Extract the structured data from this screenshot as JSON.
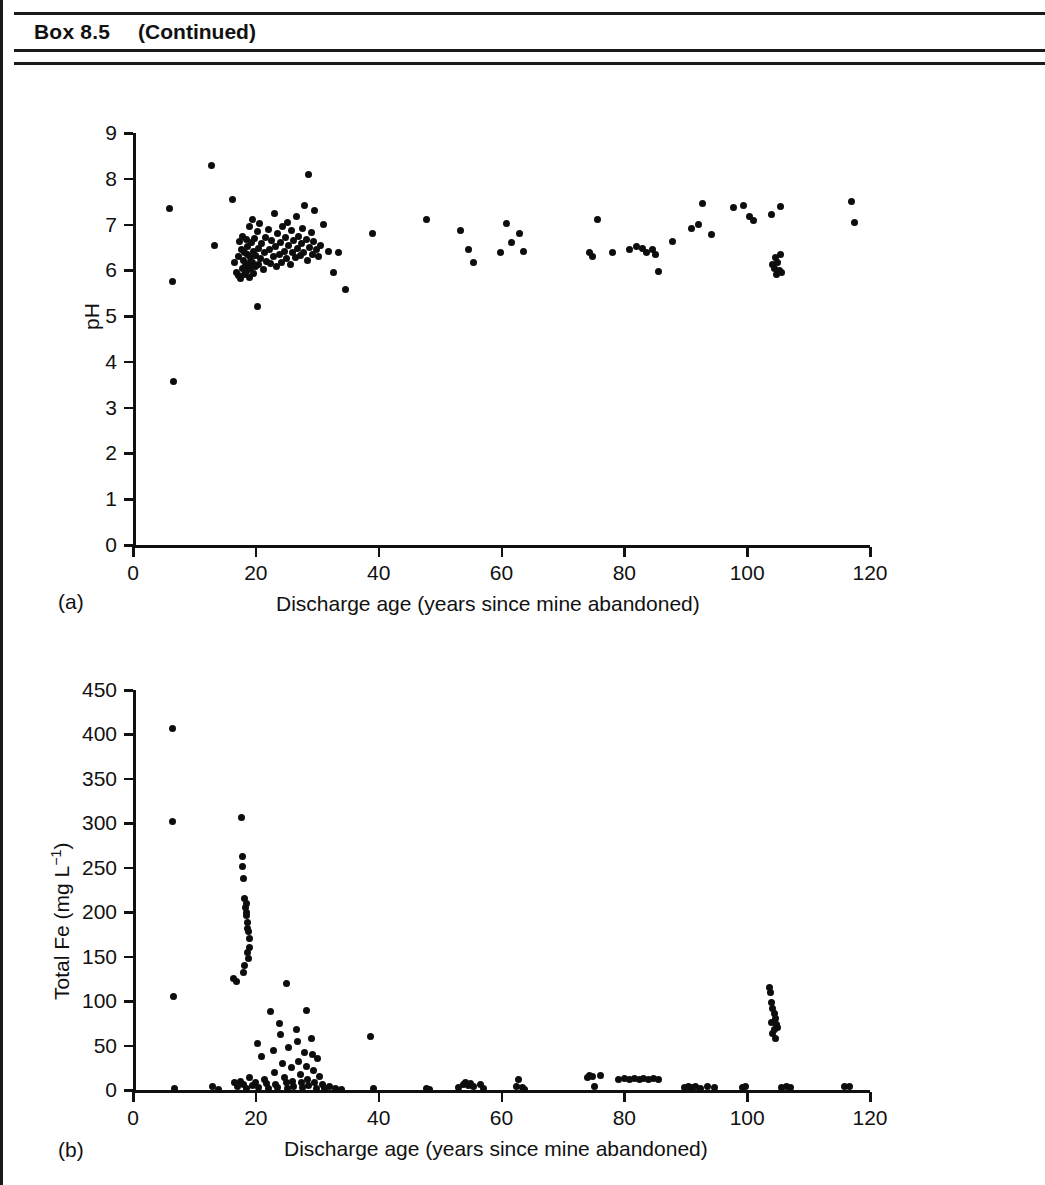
{
  "header": {
    "box_label": "Box 8.5",
    "continued_label": "(Continued)"
  },
  "panels": [
    {
      "label": "(a)"
    },
    {
      "label": "(b)"
    }
  ],
  "chart_data": [
    {
      "type": "scatter",
      "panel": "(a)",
      "title": "",
      "xlabel": "Discharge age (years since mine abandoned)",
      "ylabel": "pH",
      "xlim": [
        0,
        120
      ],
      "ylim": [
        0,
        9
      ],
      "xticks": [
        0,
        20,
        40,
        60,
        80,
        100,
        120
      ],
      "yticks": [
        0,
        1,
        2,
        3,
        4,
        5,
        6,
        7,
        8,
        9
      ],
      "grid": false,
      "legend": "none",
      "marker": "filled-circle",
      "marker_color": "#0d0d0d",
      "points": [
        [
          6.0,
          7.35
        ],
        [
          6.4,
          5.75
        ],
        [
          6.6,
          3.58
        ],
        [
          12.8,
          8.3
        ],
        [
          13.2,
          6.55
        ],
        [
          16.2,
          7.55
        ],
        [
          16.6,
          6.18
        ],
        [
          16.9,
          5.95
        ],
        [
          17.1,
          6.3
        ],
        [
          17.2,
          5.88
        ],
        [
          17.4,
          6.62
        ],
        [
          17.5,
          5.82
        ],
        [
          17.6,
          6.45
        ],
        [
          17.8,
          6.05
        ],
        [
          17.9,
          6.75
        ],
        [
          18.0,
          6.22
        ],
        [
          18.1,
          5.9
        ],
        [
          18.2,
          6.4
        ],
        [
          18.3,
          6.1
        ],
        [
          18.4,
          6.68
        ],
        [
          18.5,
          5.98
        ],
        [
          18.6,
          6.35
        ],
        [
          18.7,
          6.52
        ],
        [
          18.8,
          6.15
        ],
        [
          18.9,
          5.85
        ],
        [
          19.0,
          6.95
        ],
        [
          19.1,
          6.28
        ],
        [
          19.2,
          6.05
        ],
        [
          19.3,
          6.6
        ],
        [
          19.4,
          6.18
        ],
        [
          19.5,
          7.12
        ],
        [
          19.6,
          5.92
        ],
        [
          19.7,
          6.42
        ],
        [
          19.8,
          6.7
        ],
        [
          19.9,
          6.08
        ],
        [
          20.0,
          6.32
        ],
        [
          20.2,
          6.85
        ],
        [
          20.3,
          5.22
        ],
        [
          20.4,
          6.48
        ],
        [
          20.5,
          6.12
        ],
        [
          20.6,
          7.02
        ],
        [
          20.8,
          6.25
        ],
        [
          21.0,
          6.58
        ],
        [
          21.2,
          6.02
        ],
        [
          21.4,
          6.38
        ],
        [
          21.6,
          6.72
        ],
        [
          21.8,
          6.2
        ],
        [
          22.0,
          6.9
        ],
        [
          22.2,
          6.45
        ],
        [
          22.4,
          6.15
        ],
        [
          22.6,
          6.65
        ],
        [
          22.8,
          6.3
        ],
        [
          23.0,
          7.25
        ],
        [
          23.2,
          6.52
        ],
        [
          23.4,
          6.08
        ],
        [
          23.6,
          6.8
        ],
        [
          23.8,
          6.35
        ],
        [
          24.0,
          6.6
        ],
        [
          24.2,
          6.18
        ],
        [
          24.4,
          6.95
        ],
        [
          24.6,
          6.42
        ],
        [
          24.8,
          6.72
        ],
        [
          25.0,
          6.25
        ],
        [
          25.2,
          7.05
        ],
        [
          25.4,
          6.55
        ],
        [
          25.6,
          6.12
        ],
        [
          25.8,
          6.88
        ],
        [
          26.0,
          6.38
        ],
        [
          26.2,
          6.65
        ],
        [
          26.4,
          6.28
        ],
        [
          26.6,
          7.18
        ],
        [
          26.8,
          6.48
        ],
        [
          27.0,
          6.75
        ],
        [
          27.2,
          6.32
        ],
        [
          27.4,
          6.58
        ],
        [
          27.6,
          6.92
        ],
        [
          27.8,
          6.4
        ],
        [
          28.0,
          7.42
        ],
        [
          28.2,
          6.68
        ],
        [
          28.4,
          6.22
        ],
        [
          28.6,
          8.1
        ],
        [
          28.8,
          6.5
        ],
        [
          29.0,
          6.82
        ],
        [
          29.2,
          6.35
        ],
        [
          29.4,
          6.62
        ],
        [
          29.6,
          7.3
        ],
        [
          29.8,
          6.45
        ],
        [
          30.2,
          6.3
        ],
        [
          30.6,
          6.55
        ],
        [
          31.0,
          7.0
        ],
        [
          31.8,
          6.42
        ],
        [
          32.6,
          5.95
        ],
        [
          33.4,
          6.4
        ],
        [
          34.6,
          5.58
        ],
        [
          39.0,
          6.8
        ],
        [
          47.8,
          7.1
        ],
        [
          53.4,
          6.88
        ],
        [
          54.6,
          6.45
        ],
        [
          55.4,
          6.18
        ],
        [
          59.8,
          6.4
        ],
        [
          60.8,
          7.02
        ],
        [
          61.6,
          6.6
        ],
        [
          63.0,
          6.8
        ],
        [
          63.6,
          6.42
        ],
        [
          74.4,
          6.38
        ],
        [
          74.8,
          6.3
        ],
        [
          75.6,
          7.12
        ],
        [
          78.0,
          6.4
        ],
        [
          80.8,
          6.45
        ],
        [
          82.0,
          6.52
        ],
        [
          83.0,
          6.48
        ],
        [
          83.6,
          6.4
        ],
        [
          84.6,
          6.45
        ],
        [
          85.0,
          6.35
        ],
        [
          85.6,
          5.98
        ],
        [
          87.8,
          6.62
        ],
        [
          91.0,
          6.92
        ],
        [
          92.0,
          7.0
        ],
        [
          92.8,
          7.45
        ],
        [
          94.2,
          6.78
        ],
        [
          97.8,
          7.38
        ],
        [
          99.4,
          7.42
        ],
        [
          100.4,
          7.18
        ],
        [
          101.0,
          7.08
        ],
        [
          104.2,
          6.12
        ],
        [
          104.4,
          6.05
        ],
        [
          104.6,
          6.28
        ],
        [
          104.8,
          5.9
        ],
        [
          105.0,
          6.18
        ],
        [
          105.2,
          6.0
        ],
        [
          105.4,
          6.35
        ],
        [
          105.6,
          5.95
        ],
        [
          104.0,
          7.22
        ],
        [
          105.4,
          7.4
        ],
        [
          117.0,
          7.5
        ],
        [
          117.4,
          7.05
        ]
      ]
    },
    {
      "type": "scatter",
      "panel": "(b)",
      "title": "",
      "xlabel": "Discharge age (years since mine abandoned)",
      "ylabel": "Total Fe (mg L",
      "ylabel_sup": "−1",
      "ylabel_tail": ")",
      "xlim": [
        0,
        120
      ],
      "ylim": [
        0,
        450
      ],
      "xticks": [
        0,
        20,
        40,
        60,
        80,
        100,
        120
      ],
      "yticks": [
        0,
        50,
        100,
        150,
        200,
        250,
        300,
        350,
        400,
        450
      ],
      "grid": false,
      "legend": "none",
      "marker": "filled-circle",
      "marker_color": "#0d0d0d",
      "points": [
        [
          6.4,
          407
        ],
        [
          6.4,
          302
        ],
        [
          6.6,
          105
        ],
        [
          6.8,
          2
        ],
        [
          13.0,
          4
        ],
        [
          14.0,
          1
        ],
        [
          16.4,
          126
        ],
        [
          16.8,
          122
        ],
        [
          17.6,
          307
        ],
        [
          17.8,
          263
        ],
        [
          17.9,
          251
        ],
        [
          18.0,
          238
        ],
        [
          18.2,
          215
        ],
        [
          18.3,
          205
        ],
        [
          18.4,
          200
        ],
        [
          18.5,
          196
        ],
        [
          18.6,
          188
        ],
        [
          18.7,
          182
        ],
        [
          18.8,
          178
        ],
        [
          18.4,
          210
        ],
        [
          18.9,
          170
        ],
        [
          19.0,
          160
        ],
        [
          18.6,
          155
        ],
        [
          18.8,
          148
        ],
        [
          18.2,
          140
        ],
        [
          18.0,
          132
        ],
        [
          16.5,
          8
        ],
        [
          17.0,
          4
        ],
        [
          17.5,
          10
        ],
        [
          18.0,
          6
        ],
        [
          18.5,
          2
        ],
        [
          19.0,
          14
        ],
        [
          19.5,
          5
        ],
        [
          20.0,
          9
        ],
        [
          20.5,
          3
        ],
        [
          20.2,
          52
        ],
        [
          21.0,
          38
        ],
        [
          21.4,
          12
        ],
        [
          21.8,
          7
        ],
        [
          22.0,
          2
        ],
        [
          22.4,
          88
        ],
        [
          22.8,
          45
        ],
        [
          23.0,
          20
        ],
        [
          23.2,
          6
        ],
        [
          23.6,
          3
        ],
        [
          23.8,
          75
        ],
        [
          24.0,
          62
        ],
        [
          24.4,
          30
        ],
        [
          24.6,
          14
        ],
        [
          25.0,
          8
        ],
        [
          25.2,
          2
        ],
        [
          25.4,
          48
        ],
        [
          25.8,
          25
        ],
        [
          26.0,
          10
        ],
        [
          26.2,
          4
        ],
        [
          26.6,
          68
        ],
        [
          26.8,
          55
        ],
        [
          27.0,
          32
        ],
        [
          27.2,
          18
        ],
        [
          27.4,
          8
        ],
        [
          27.6,
          3
        ],
        [
          28.0,
          42
        ],
        [
          28.2,
          26
        ],
        [
          28.4,
          12
        ],
        [
          28.6,
          5
        ],
        [
          29.0,
          58
        ],
        [
          29.2,
          40
        ],
        [
          29.4,
          22
        ],
        [
          29.6,
          9
        ],
        [
          29.8,
          2
        ],
        [
          30.0,
          35
        ],
        [
          30.4,
          15
        ],
        [
          30.8,
          6
        ],
        [
          31.2,
          2
        ],
        [
          32.0,
          4
        ],
        [
          25.0,
          120
        ],
        [
          28.2,
          90
        ],
        [
          33.0,
          2
        ],
        [
          34.0,
          1
        ],
        [
          38.6,
          60
        ],
        [
          39.2,
          2
        ],
        [
          47.8,
          2
        ],
        [
          48.2,
          1
        ],
        [
          53.0,
          3
        ],
        [
          53.8,
          6
        ],
        [
          54.2,
          8
        ],
        [
          54.6,
          5
        ],
        [
          55.0,
          7
        ],
        [
          55.4,
          4
        ],
        [
          56.6,
          6
        ],
        [
          57.0,
          2
        ],
        [
          62.4,
          4
        ],
        [
          62.8,
          12
        ],
        [
          63.4,
          3
        ],
        [
          63.8,
          1
        ],
        [
          74.0,
          14
        ],
        [
          74.4,
          16
        ],
        [
          74.8,
          15
        ],
        [
          75.2,
          4
        ],
        [
          76.2,
          16
        ],
        [
          79.0,
          12
        ],
        [
          80.0,
          13
        ],
        [
          80.8,
          12
        ],
        [
          81.6,
          13
        ],
        [
          82.4,
          12
        ],
        [
          83.2,
          13
        ],
        [
          84.0,
          12
        ],
        [
          84.8,
          13
        ],
        [
          85.6,
          12
        ],
        [
          89.8,
          3
        ],
        [
          90.4,
          4
        ],
        [
          91.0,
          3
        ],
        [
          91.6,
          4
        ],
        [
          92.4,
          2
        ],
        [
          93.6,
          4
        ],
        [
          94.6,
          3
        ],
        [
          99.2,
          3
        ],
        [
          99.8,
          4
        ],
        [
          103.6,
          115
        ],
        [
          103.8,
          110
        ],
        [
          104.0,
          98
        ],
        [
          104.2,
          92
        ],
        [
          104.4,
          86
        ],
        [
          104.6,
          80
        ],
        [
          104.8,
          74
        ],
        [
          105.0,
          70
        ],
        [
          104.2,
          64
        ],
        [
          104.6,
          58
        ],
        [
          104.0,
          76
        ],
        [
          104.4,
          68
        ],
        [
          105.6,
          3
        ],
        [
          106.4,
          4
        ],
        [
          107.0,
          3
        ],
        [
          115.8,
          4
        ],
        [
          116.6,
          4
        ]
      ]
    }
  ]
}
